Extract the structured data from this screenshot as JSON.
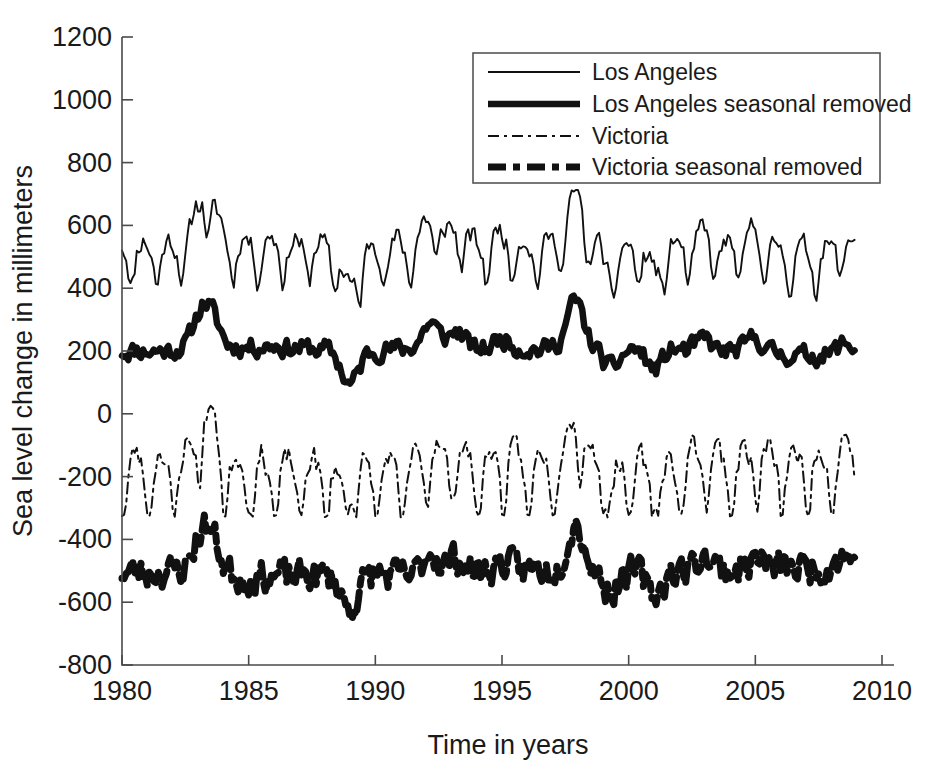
{
  "chart_data": {
    "type": "line",
    "title": "",
    "xlabel": "Time in years",
    "ylabel": "Sea level change in millimeters",
    "xlim": [
      1980,
      2010
    ],
    "ylim": [
      -800,
      1200
    ],
    "xticks": [
      1980,
      1985,
      1990,
      1995,
      2000,
      2005,
      2010
    ],
    "xtick_labels": [
      "1980",
      "1985",
      "1990",
      "1995",
      "2000",
      "2005",
      "2010"
    ],
    "yticks": [
      -800,
      -600,
      -400,
      -200,
      0,
      200,
      400,
      600,
      800,
      1000,
      1200
    ],
    "ytick_labels": [
      "-800",
      "-600",
      "-400",
      "-200",
      "0",
      "200",
      "400",
      "600",
      "800",
      "1000",
      "1200"
    ],
    "grid": false,
    "legend_position": "top-right",
    "data_start": 1980.0,
    "data_end": 2008.9,
    "sample_interval_years": 0.08333,
    "series": [
      {
        "name": "Los Angeles",
        "style": "solid-thin",
        "stroke_width": 1.9,
        "dash": "none",
        "offset": 500,
        "seasonal_amplitude": 65,
        "seasonal_phase": 0.62,
        "noise_amplitude": 38,
        "seed": 11,
        "mean": 500,
        "min": 340,
        "max": 715
      },
      {
        "name": "Los Angeles seasonal removed",
        "style": "solid-thick",
        "stroke_width": 6.5,
        "dash": "none",
        "offset": 200,
        "seasonal_amplitude": 0,
        "seasonal_phase": 0,
        "noise_amplitude": 34,
        "seed": 11,
        "mean": 200,
        "min": 70,
        "max": 395
      },
      {
        "name": "Victoria",
        "style": "dashdot-thin",
        "stroke_width": 2.0,
        "dash": "11,5,3,5",
        "offset": -200,
        "seasonal_amplitude": 105,
        "seasonal_phase": 0.3,
        "noise_amplitude": 42,
        "seed": 23,
        "mean": -200,
        "min": -330,
        "max": 120
      },
      {
        "name": "Victoria seasonal removed",
        "style": "dashed-thick",
        "stroke_width": 7.0,
        "dash": "18,7,7,7",
        "offset": -500,
        "seasonal_amplitude": 0,
        "seasonal_phase": 0,
        "noise_amplitude": 58,
        "seed": 23,
        "mean": -500,
        "min": -725,
        "max": -255
      }
    ],
    "events": [
      {
        "year": 1983.1,
        "label": "1982-83 El Nino",
        "anomaly": 115
      },
      {
        "year": 1983.6,
        "label": "1983 peak",
        "anomaly": 95
      },
      {
        "year": 1986.0,
        "label": "",
        "anomaly": 10
      },
      {
        "year": 1989.0,
        "label": "1989 low",
        "anomaly": -120
      },
      {
        "year": 1992.2,
        "label": "1992 El Nino",
        "anomaly": 90
      },
      {
        "year": 1993.2,
        "label": "",
        "anomaly": 55
      },
      {
        "year": 1995.0,
        "label": "",
        "anomaly": 35
      },
      {
        "year": 1997.9,
        "label": "1997-98 El Nino",
        "anomaly": 160
      },
      {
        "year": 1999.3,
        "label": "1999 low",
        "anomaly": -70
      },
      {
        "year": 2001.0,
        "label": "2001 low",
        "anomaly": -75
      },
      {
        "year": 2003.0,
        "label": "",
        "anomaly": 50
      },
      {
        "year": 2005.0,
        "label": "",
        "anomaly": 45
      },
      {
        "year": 2008.5,
        "label": "",
        "anomaly": 40
      }
    ]
  },
  "legend": {
    "entries": [
      {
        "label": "Los Angeles"
      },
      {
        "label": "Los Angeles seasonal removed"
      },
      {
        "label": "Victoria"
      },
      {
        "label": "Victoria seasonal removed"
      }
    ]
  },
  "axes": {
    "x_title": "Time in years",
    "y_title": "Sea level change in millimeters"
  },
  "colors": {
    "line": "#111111",
    "axis": "#4a4a4a",
    "text": "#1a1a1a",
    "background": "#ffffff"
  }
}
